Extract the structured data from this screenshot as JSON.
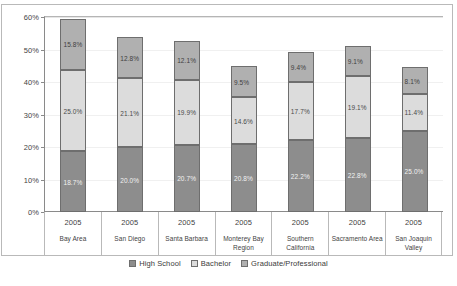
{
  "chart_data": {
    "type": "bar",
    "stacked": true,
    "title": "",
    "xlabel": "",
    "ylabel": "",
    "ylim": [
      0,
      60
    ],
    "ytick_labels": [
      "0%",
      "10%",
      "20%",
      "30%",
      "40%",
      "50%",
      "60%"
    ],
    "yticks": [
      0,
      10,
      20,
      30,
      40,
      50,
      60
    ],
    "grid": true,
    "legend_position": "bottom",
    "categories": [
      "Bay Area",
      "San Diego",
      "Santa Barbara",
      "Monterey Bay Region",
      "Southern California",
      "Sacramento Area",
      "San Joaquin Valley"
    ],
    "category_years": [
      "2005",
      "2005",
      "2005",
      "2005",
      "2005",
      "2005",
      "2005"
    ],
    "series": [
      {
        "name": "High School",
        "color": "#8d8d8d",
        "values": [
          18.7,
          20.0,
          20.7,
          20.8,
          22.2,
          22.8,
          25.0
        ],
        "labels": [
          "18.7%",
          "20.0%",
          "20.7%",
          "20.8%",
          "22.2%",
          "22.8%",
          "25.0%"
        ]
      },
      {
        "name": "Bachelor",
        "color": "#dcdcdc",
        "values": [
          25.0,
          21.1,
          19.9,
          14.6,
          17.7,
          19.1,
          11.4
        ],
        "labels": [
          "25.0%",
          "21.1%",
          "19.9%",
          "14.6%",
          "17.7%",
          "19.1%",
          "11.4%"
        ]
      },
      {
        "name": "Graduate/Professional",
        "color": "#b0b0b0",
        "values": [
          15.8,
          12.8,
          12.1,
          9.5,
          9.4,
          9.1,
          8.1
        ],
        "labels": [
          "15.8%",
          "12.8%",
          "12.1%",
          "9.5%",
          "9.4%",
          "9.1%",
          "8.1%"
        ]
      }
    ],
    "totals": [
      59.5,
      53.9,
      52.7,
      44.9,
      49.3,
      51.0,
      44.5
    ]
  },
  "legend": {
    "items": [
      {
        "label": "High School",
        "swatch": "#8d8d8d"
      },
      {
        "label": "Bachelor",
        "swatch": "#dcdcdc"
      },
      {
        "label": "Graduate/Professional",
        "swatch": "#b0b0b0"
      }
    ]
  }
}
